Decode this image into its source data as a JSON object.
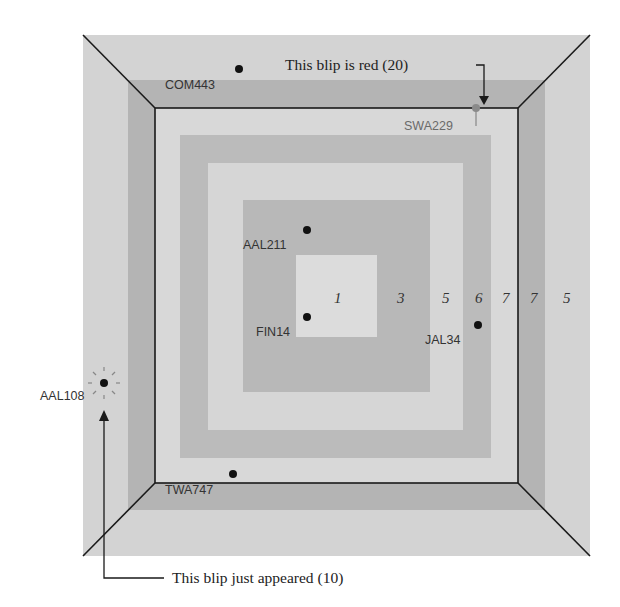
{
  "diagram": {
    "colors": {
      "outer_band": "#d3d3d3",
      "dark_band": "#b2b2b2",
      "light_band": "#d6d6d6",
      "mid_band": "#b8b8b8",
      "center": "#dcdcdc",
      "frame": "#1a1a1a",
      "blip": "#111111",
      "red_blip": "#8a8a8a"
    },
    "band_numbers": [
      "1",
      "3",
      "5",
      "6",
      "7",
      "7",
      "5"
    ],
    "blips": [
      {
        "id": "COM443",
        "label": "COM443"
      },
      {
        "id": "SWA229",
        "label": "SWA229"
      },
      {
        "id": "AAL211",
        "label": "AAL211"
      },
      {
        "id": "FIN14",
        "label": "FIN14"
      },
      {
        "id": "JAL34",
        "label": "JAL34"
      },
      {
        "id": "AAL108",
        "label": "AAL108"
      },
      {
        "id": "TWA747",
        "label": "TWA747"
      }
    ],
    "annotations": {
      "red_blip": "This blip is red (20)",
      "new_blip": "This blip just appeared (10)"
    }
  }
}
